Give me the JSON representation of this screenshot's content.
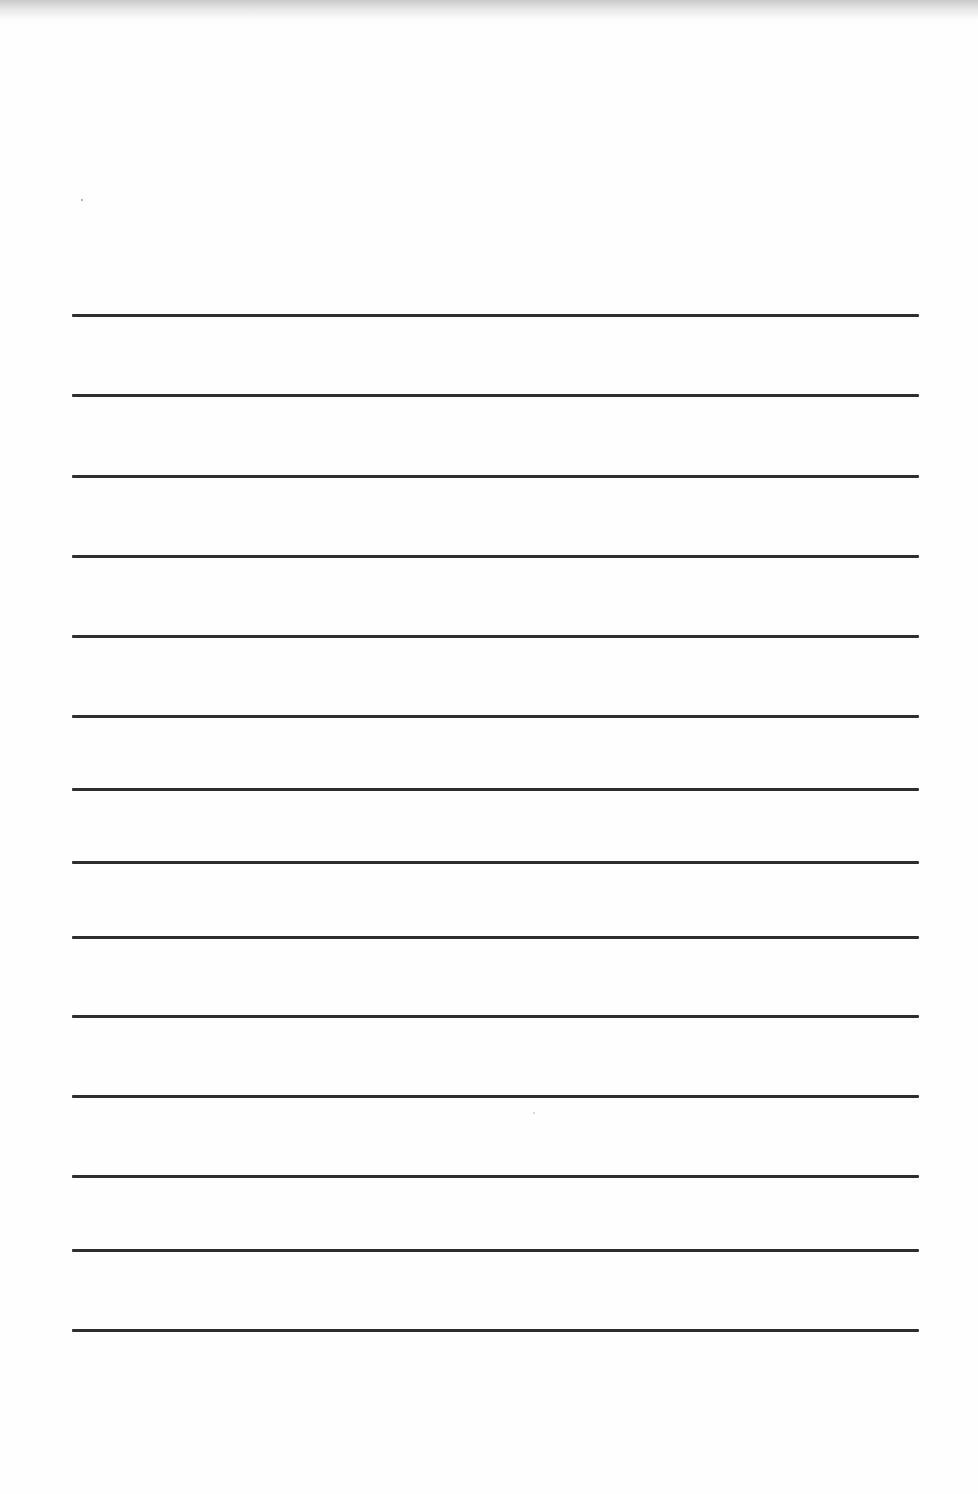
{
  "document": {
    "type": "lined-paper",
    "background_color": "#ffffff",
    "line_color": "#2e2e2e",
    "line_count": 14,
    "line_left_x": 72,
    "line_right_x": 919,
    "line_thickness_px": 3,
    "lines_y": [
      315,
      395,
      476,
      556,
      636,
      716,
      789,
      862,
      937,
      1016,
      1096,
      1176,
      1250,
      1330
    ]
  }
}
